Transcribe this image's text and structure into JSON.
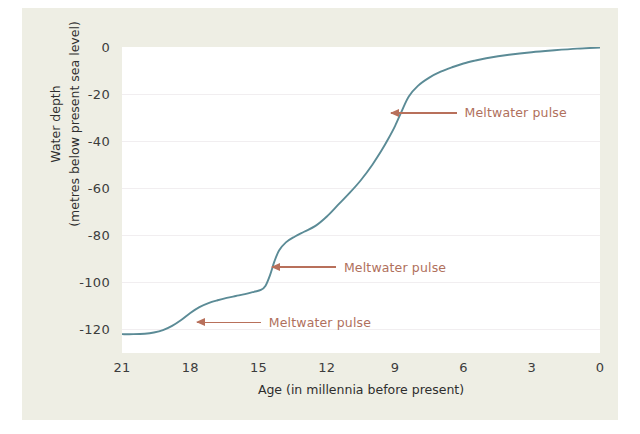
{
  "chart_data": {
    "type": "line",
    "title": "",
    "xlabel": "Age (in millennia before present)",
    "ylabel_line1": "Water depth",
    "ylabel_line2": "(metres below present sea level)",
    "xlim": [
      21,
      0
    ],
    "ylim": [
      -130,
      0
    ],
    "x_ticks": [
      21,
      18,
      15,
      12,
      9,
      6,
      3,
      0
    ],
    "y_ticks": [
      0,
      -20,
      -40,
      -60,
      -80,
      -100,
      -120
    ],
    "x_tick_labels": [
      "21",
      "18",
      "15",
      "12",
      "9",
      "6",
      "3",
      "0"
    ],
    "y_tick_labels": [
      "0",
      "-20",
      "-40",
      "-60",
      "-80",
      "-100",
      "-120"
    ],
    "grid": "horizontal-faint",
    "legend": "none",
    "series": [
      {
        "name": "Sea level",
        "color": "#5b8b96",
        "x": [
          21.0,
          20.5,
          20.0,
          19.6,
          19.2,
          18.8,
          18.4,
          18.0,
          17.6,
          17.2,
          16.8,
          16.4,
          16.0,
          15.6,
          15.2,
          14.9,
          14.7,
          14.5,
          14.3,
          14.1,
          13.8,
          13.4,
          13.0,
          12.5,
          12.0,
          11.5,
          11.0,
          10.5,
          10.0,
          9.6,
          9.3,
          9.0,
          8.7,
          8.4,
          8.0,
          7.5,
          7.0,
          6.5,
          6.0,
          5.5,
          5.0,
          4.0,
          3.0,
          2.0,
          1.0,
          0.0
        ],
        "y": [
          -122.0,
          -122.0,
          -121.8,
          -121.3,
          -120.3,
          -118.5,
          -116.0,
          -113.0,
          -110.5,
          -108.8,
          -107.6,
          -106.6,
          -105.8,
          -105.0,
          -104.0,
          -103.2,
          -101.5,
          -97.0,
          -91.0,
          -86.5,
          -83.0,
          -80.5,
          -78.5,
          -76.0,
          -72.0,
          -67.0,
          -62.0,
          -56.5,
          -50.0,
          -44.0,
          -39.0,
          -33.5,
          -27.0,
          -21.0,
          -16.5,
          -13.0,
          -10.5,
          -8.6,
          -7.0,
          -5.8,
          -4.8,
          -3.3,
          -2.2,
          -1.4,
          -0.7,
          -0.2
        ]
      }
    ],
    "annotations": [
      {
        "label": "Meltwater pulse",
        "target_x": 9.2,
        "target_y": -28.0,
        "text_x": 6.3,
        "text_y": -28.0
      },
      {
        "label": "Meltwater pulse",
        "target_x": 14.4,
        "target_y": -93.5,
        "text_x": 11.6,
        "text_y": -93.5
      },
      {
        "label": "Meltwater pulse",
        "target_x": 17.7,
        "target_y": -117.0,
        "text_x": 14.9,
        "text_y": -117.0
      }
    ]
  },
  "colors": {
    "figure_background": "#eeeee4",
    "plot_background": "#ffffff",
    "curve": "#5b8b96",
    "annotation": "#b0705c",
    "arrow": "#b8705b",
    "tick_text": "#3c3c3c",
    "axis_title": "#2e2e2e",
    "gridline": "#f1eef0"
  }
}
